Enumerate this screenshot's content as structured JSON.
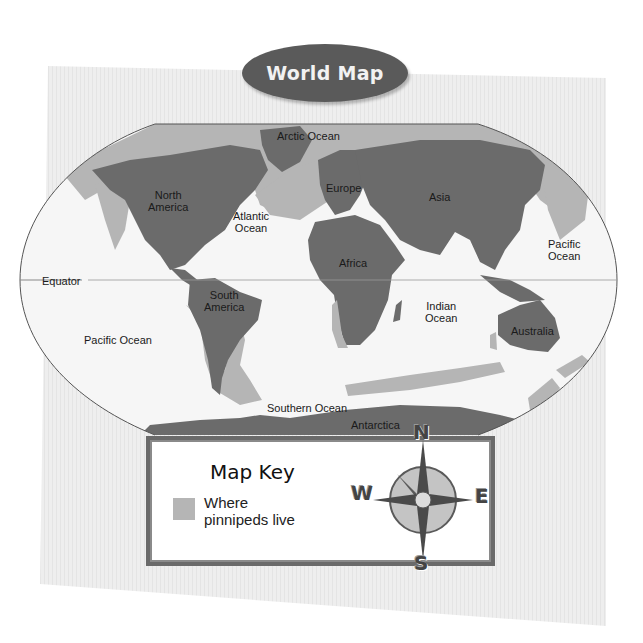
{
  "title": "World Map",
  "colors": {
    "land": "#6b6b6b",
    "pinniped_range": "#b5b5b5",
    "ocean": "#f4f4f4",
    "sheet": "#ececec",
    "title_pill": "#5a5a5a",
    "key_border": "#6a6a6a"
  },
  "map": {
    "continents": [
      {
        "name": "North America",
        "line1": "North",
        "line2": "America"
      },
      {
        "name": "South America",
        "line1": "South",
        "line2": "America"
      },
      {
        "name": "Europe",
        "line1": "Europe"
      },
      {
        "name": "Asia",
        "line1": "Asia"
      },
      {
        "name": "Africa",
        "line1": "Africa"
      },
      {
        "name": "Australia",
        "line1": "Australia"
      },
      {
        "name": "Antarctica",
        "line1": "Antarctica"
      }
    ],
    "oceans": [
      {
        "name": "Arctic Ocean",
        "line1": "Arctic Ocean"
      },
      {
        "name": "Atlantic Ocean",
        "line1": "Atlantic",
        "line2": "Ocean"
      },
      {
        "name": "Pacific Ocean (east)",
        "line1": "Pacific",
        "line2": "Ocean"
      },
      {
        "name": "Pacific Ocean (west)",
        "line1": "Pacific Ocean"
      },
      {
        "name": "Indian Ocean",
        "line1": "Indian",
        "line2": "Ocean"
      },
      {
        "name": "Southern Ocean",
        "line1": "Southern Ocean"
      }
    ],
    "lines": {
      "equator": "Equator"
    }
  },
  "map_key": {
    "title": "Map Key",
    "items": [
      {
        "swatch": "light-gray",
        "line1": "Where",
        "line2": "pinnipeds live"
      }
    ]
  },
  "compass": {
    "north": "N",
    "south": "S",
    "east": "E",
    "west": "W"
  }
}
